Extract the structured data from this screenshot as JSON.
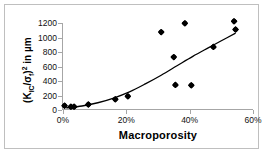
{
  "chart_data": {
    "type": "scatter",
    "title": "",
    "xlabel": "Macroporosity",
    "ylabel": "(KIC/σf)² in µm",
    "xlabel_plain": "Macroporosity",
    "ylabel_parts": {
      "open": "(K",
      "sub1": "IC",
      "slash": "/σ",
      "sub2": "f",
      "close": ")",
      "sup": "2",
      "tail": " in µm"
    },
    "xlim": [
      0,
      60
    ],
    "ylim": [
      0,
      1200
    ],
    "x_unit": "%",
    "xticks": [
      0,
      20,
      40,
      60
    ],
    "xticklabels": [
      "0%",
      "20%",
      "40%",
      "60%"
    ],
    "yticks": [
      0,
      200,
      400,
      600,
      800,
      1000,
      1200
    ],
    "yticklabels": [
      "0",
      "200",
      "400",
      "600",
      "800",
      "1000",
      "1200"
    ],
    "grid": false,
    "legend": false,
    "marker": "diamond",
    "marker_color": "#000000",
    "points": [
      {
        "x": 0.5,
        "y": 60
      },
      {
        "x": 2.5,
        "y": 45
      },
      {
        "x": 3.5,
        "y": 45
      },
      {
        "x": 8.0,
        "y": 75
      },
      {
        "x": 16.5,
        "y": 150
      },
      {
        "x": 20.5,
        "y": 190
      },
      {
        "x": 31.0,
        "y": 1075
      },
      {
        "x": 35.0,
        "y": 730
      },
      {
        "x": 35.5,
        "y": 345
      },
      {
        "x": 38.5,
        "y": 1195
      },
      {
        "x": 40.5,
        "y": 340
      },
      {
        "x": 47.5,
        "y": 870
      },
      {
        "x": 54.0,
        "y": 1225
      },
      {
        "x": 54.5,
        "y": 1110
      }
    ],
    "trendline": {
      "present": true,
      "color": "#000000",
      "points": [
        {
          "x": 1.0,
          "y": 30
        },
        {
          "x": 6.0,
          "y": 55
        },
        {
          "x": 11.0,
          "y": 100
        },
        {
          "x": 16.0,
          "y": 165
        },
        {
          "x": 21.0,
          "y": 250
        },
        {
          "x": 26.0,
          "y": 360
        },
        {
          "x": 31.0,
          "y": 480
        },
        {
          "x": 36.0,
          "y": 610
        },
        {
          "x": 41.0,
          "y": 740
        },
        {
          "x": 46.0,
          "y": 860
        },
        {
          "x": 50.0,
          "y": 955
        },
        {
          "x": 54.5,
          "y": 1060
        }
      ]
    }
  },
  "figure": {
    "background_color": "#ffffff",
    "border_color": "#bfbfbf",
    "axis_color": "#a6a6a6"
  }
}
